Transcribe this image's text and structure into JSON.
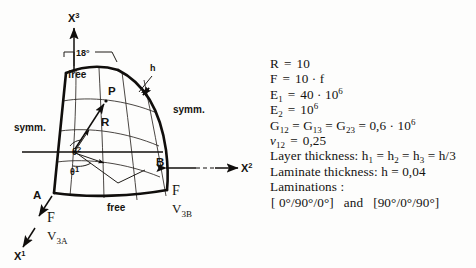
{
  "figure": {
    "axes": [
      {
        "id": "x3",
        "base": "X",
        "exponent": "3"
      },
      {
        "id": "x2",
        "base": "X",
        "exponent": "2"
      },
      {
        "id": "x1",
        "base": "X",
        "exponent": "1"
      }
    ],
    "angle_annotation": "18°",
    "boundary_labels": [
      {
        "id": "free-top",
        "text": "free"
      },
      {
        "id": "symm-left",
        "text": "symm."
      },
      {
        "id": "symm-right",
        "text": "symm."
      },
      {
        "id": "free-bottom",
        "text": "free"
      }
    ],
    "point_labels": [
      {
        "id": "point-p",
        "text": "P"
      },
      {
        "id": "vector-r",
        "text": "R"
      },
      {
        "id": "thickness-h",
        "text": "h"
      },
      {
        "id": "point-a",
        "text": "A"
      },
      {
        "id": "point-b",
        "text": "B"
      }
    ],
    "angle_coords": [
      {
        "id": "theta2",
        "base": "θ",
        "exponent": "2"
      },
      {
        "id": "theta1",
        "base": "θ",
        "exponent": "1"
      }
    ],
    "loads": [
      {
        "id": "force-a",
        "force": "F",
        "disp_base": "V",
        "disp_sub": "3A"
      },
      {
        "id": "force-b",
        "force": "F",
        "disp_base": "V",
        "disp_sub": "3B"
      }
    ]
  },
  "properties": {
    "lines": [
      {
        "id": "radius",
        "label": "R",
        "eq": "=",
        "value": "10"
      },
      {
        "id": "force",
        "label": "F",
        "eq": "=",
        "value": "10 · f"
      },
      {
        "id": "e1",
        "label": "E",
        "sub": "1",
        "eq": "=",
        "value": "40 · 10",
        "sup": "6"
      },
      {
        "id": "e2",
        "label": "E",
        "sub": "2",
        "eq": "=",
        "value": "10",
        "sup": "6"
      },
      {
        "id": "shear",
        "label": "G",
        "sub": "12",
        "value": "0,6 · 10",
        "sup": "6"
      },
      {
        "id": "poisson",
        "label": "ν",
        "sub": "12",
        "eq": "=",
        "value": "0,25"
      }
    ],
    "shear_text": "G12 = G13 = G23 = 0,6 · 106",
    "layer_thickness_label": "Layer thickness:",
    "layer_thickness_value": "h1 = h2 = h3 = h/3",
    "laminate_thickness_label": "Laminate thickness:",
    "laminate_thickness_value": "h = 0,04",
    "laminations_label": "Laminations :",
    "lamination_1": "[ 0°/90°/0°]",
    "lamination_conj": "and",
    "lamination_2": "[90°/0°/90°]"
  },
  "colors": {
    "ink": "#15130f",
    "paper": "#fdfdfc",
    "mesh": "#2a2622"
  }
}
